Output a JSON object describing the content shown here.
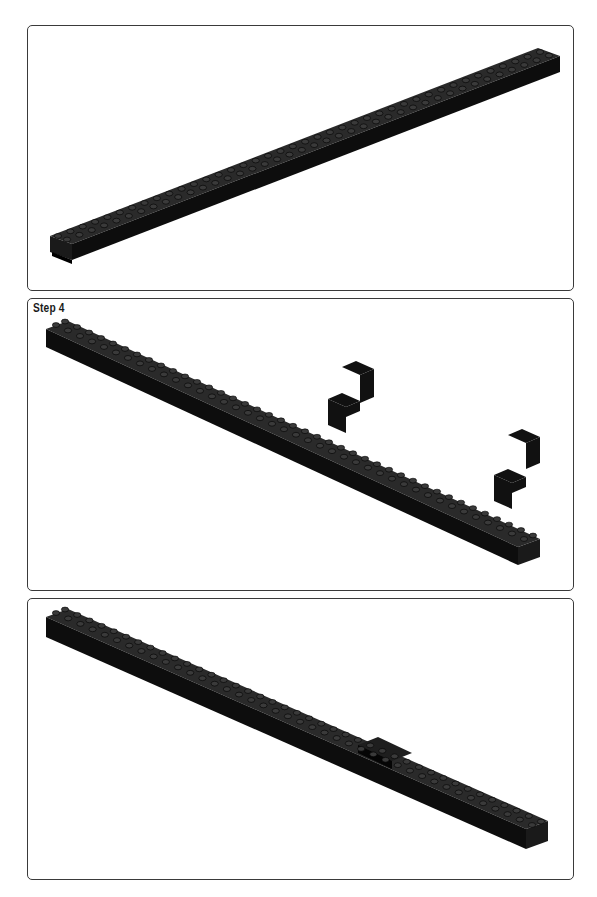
{
  "page": {
    "background": "#ffffff",
    "panel_border_color": "#3a3a3a",
    "brick_color": "#111111"
  },
  "panels": [
    {
      "id": "panel-1",
      "step_label": null,
      "content": "single long black technic beam, diagonal from lower-left to upper-right"
    },
    {
      "id": "panel-2",
      "step_label": "Step 4",
      "content": "long black technic beam diagonal from upper-left to lower-right, with four black angle brackets (1x2-2x2) floating above"
    },
    {
      "id": "panel-3",
      "step_label": null,
      "content": "two joined long black technic beams diagonal from upper-left to lower-right, joined by a plate near the middle"
    }
  ]
}
